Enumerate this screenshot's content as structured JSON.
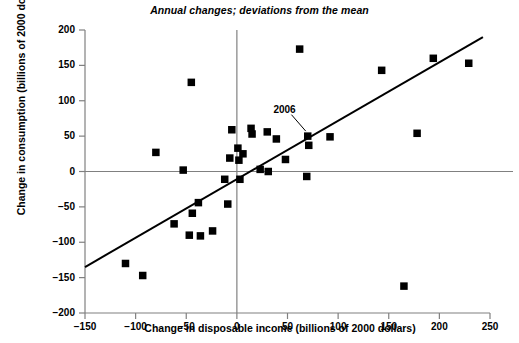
{
  "chart_data": {
    "type": "scatter",
    "title": "Annual changes; deviations from the mean",
    "xlabel": "Change in disposable income (billions of 2000 dollars)",
    "ylabel": "Change in consumption (billions of 2000 dollars)",
    "xlim": [
      -150,
      250
    ],
    "ylim": [
      -200,
      200
    ],
    "xticks": [
      -150,
      -100,
      -50,
      0,
      50,
      100,
      150,
      200,
      250
    ],
    "xtick_labels": [
      "−150",
      "−100",
      "−50",
      "0",
      "50",
      "100",
      "150",
      "200",
      "250"
    ],
    "yticks": [
      -200,
      -150,
      -100,
      -50,
      0,
      50,
      100,
      150,
      200
    ],
    "ytick_labels": [
      "−200",
      "−150",
      "−100",
      "−50",
      "0",
      "50",
      "100",
      "150",
      "200"
    ],
    "grid": false,
    "legend": null,
    "marker": "square",
    "marker_color": "#000000",
    "points": [
      {
        "x": -110,
        "y": -130
      },
      {
        "x": -93,
        "y": -147
      },
      {
        "x": -80,
        "y": 27
      },
      {
        "x": -62,
        "y": -74
      },
      {
        "x": -53,
        "y": 2
      },
      {
        "x": -47,
        "y": -90
      },
      {
        "x": -45,
        "y": 126
      },
      {
        "x": -44,
        "y": -59
      },
      {
        "x": -38,
        "y": -44
      },
      {
        "x": -36,
        "y": -91
      },
      {
        "x": -24,
        "y": -84
      },
      {
        "x": -12,
        "y": -11
      },
      {
        "x": -9,
        "y": -46
      },
      {
        "x": -7,
        "y": 19
      },
      {
        "x": -5,
        "y": 59
      },
      {
        "x": 1,
        "y": 33
      },
      {
        "x": 2,
        "y": 16
      },
      {
        "x": 3,
        "y": -11
      },
      {
        "x": 6,
        "y": 25
      },
      {
        "x": 14,
        "y": 61
      },
      {
        "x": 15,
        "y": 53
      },
      {
        "x": 23,
        "y": 3
      },
      {
        "x": 30,
        "y": 56
      },
      {
        "x": 31,
        "y": 0
      },
      {
        "x": 39,
        "y": 46
      },
      {
        "x": 48,
        "y": 17
      },
      {
        "x": 62,
        "y": 173
      },
      {
        "x": 69,
        "y": -7
      },
      {
        "x": 70,
        "y": 50
      },
      {
        "x": 71,
        "y": 37
      },
      {
        "x": 92,
        "y": 49
      },
      {
        "x": 143,
        "y": 143
      },
      {
        "x": 165,
        "y": -162
      },
      {
        "x": 178,
        "y": 54
      },
      {
        "x": 194,
        "y": 160
      },
      {
        "x": 229,
        "y": 153
      }
    ],
    "trendline": {
      "x0": -150,
      "y0": -135,
      "x1": 243,
      "y1": 190,
      "color": "#000000"
    },
    "annotations": [
      {
        "label": "2006",
        "label_x": 44,
        "label_y": 86,
        "point_x": 70,
        "point_y": 50
      }
    ],
    "reference_lines": [
      {
        "orientation": "horizontal",
        "value": 0,
        "color": "#808080"
      },
      {
        "orientation": "vertical",
        "value": 0,
        "color": "#808080"
      }
    ],
    "axis_color": "#808080"
  }
}
